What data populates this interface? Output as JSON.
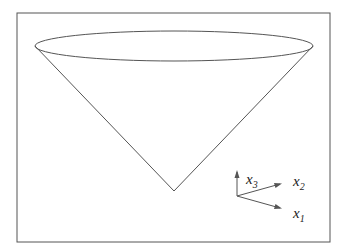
{
  "figure": {
    "type": "cone-diagram",
    "axes": [
      {
        "name": "x1",
        "base": "x",
        "sub": "1"
      },
      {
        "name": "x2",
        "base": "x",
        "sub": "2"
      },
      {
        "name": "x3",
        "base": "x",
        "sub": "3"
      }
    ],
    "colors": {
      "stroke": "#555555",
      "background": "#ffffff",
      "text": "#222222"
    }
  }
}
